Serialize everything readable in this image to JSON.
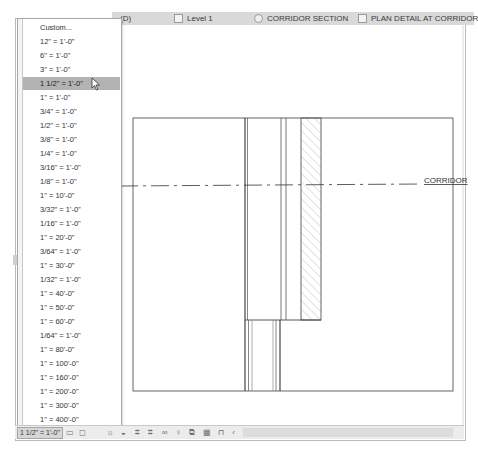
{
  "tabs": [
    {
      "label": "(D)",
      "icon": "none"
    },
    {
      "label": "Level 1",
      "icon": "plan-view-icon"
    },
    {
      "label": "CORRIDOR SECTION",
      "icon": "section-view-icon"
    },
    {
      "label": "PLAN DETAIL AT CORRIDOR",
      "icon": "detail-view-icon"
    }
  ],
  "scale_dropdown": {
    "selected": "1 1/2\" = 1'-0\"",
    "items": [
      "Custom...",
      "12\" = 1'-0\"",
      "6\" = 1'-0\"",
      "3\" = 1'-0\"",
      "1 1/2\" = 1'-0\"",
      "1\" = 1'-0\"",
      "3/4\" = 1'-0\"",
      "1/2\" = 1'-0\"",
      "3/8\" = 1'-0\"",
      "1/4\" = 1'-0\"",
      "3/16\" = 1'-0\"",
      "1/8\" = 1'-0\"",
      "1\" = 10'-0\"",
      "3/32\" = 1'-0\"",
      "1/16\" = 1'-0\"",
      "1\" = 20'-0\"",
      "3/64\" = 1'-0\"",
      "1\" = 30'-0\"",
      "1/32\" = 1'-0\"",
      "1\" = 40'-0\"",
      "1\" = 50'-0\"",
      "1\" = 60'-0\"",
      "1/64\" = 1'-0\"",
      "1\" = 80'-0\"",
      "1\" = 100'-0\"",
      "1\" = 160'-0\"",
      "1\" = 200'-0\"",
      "1\" = 300'-0\"",
      "1\" = 400'-0\""
    ],
    "highlighted_index": 4
  },
  "drawing": {
    "section_label": "CORRIDOR"
  },
  "statusbar": {
    "scale_value": "1 1/2\" = 1'-0\"",
    "icons": [
      {
        "name": "detail-level-icon",
        "glyph": "▭"
      },
      {
        "name": "visual-style-icon",
        "glyph": "◻"
      },
      {
        "name": "sun-path-icon",
        "glyph": "☼"
      },
      {
        "name": "shadows-icon",
        "glyph": "◒"
      },
      {
        "name": "crop-view-icon",
        "glyph": "⌗"
      },
      {
        "name": "show-crop-region-icon",
        "glyph": "⌗"
      },
      {
        "name": "temporary-hide-icon",
        "glyph": "∞"
      },
      {
        "name": "reveal-hidden-icon",
        "glyph": "♀"
      },
      {
        "name": "temporary-view-properties-icon",
        "glyph": "⧉"
      },
      {
        "name": "worksharing-display-icon",
        "glyph": "▦"
      },
      {
        "name": "reveal-constraints-icon",
        "glyph": "⊓"
      },
      {
        "name": "scroll-left-icon",
        "glyph": "‹"
      }
    ]
  }
}
